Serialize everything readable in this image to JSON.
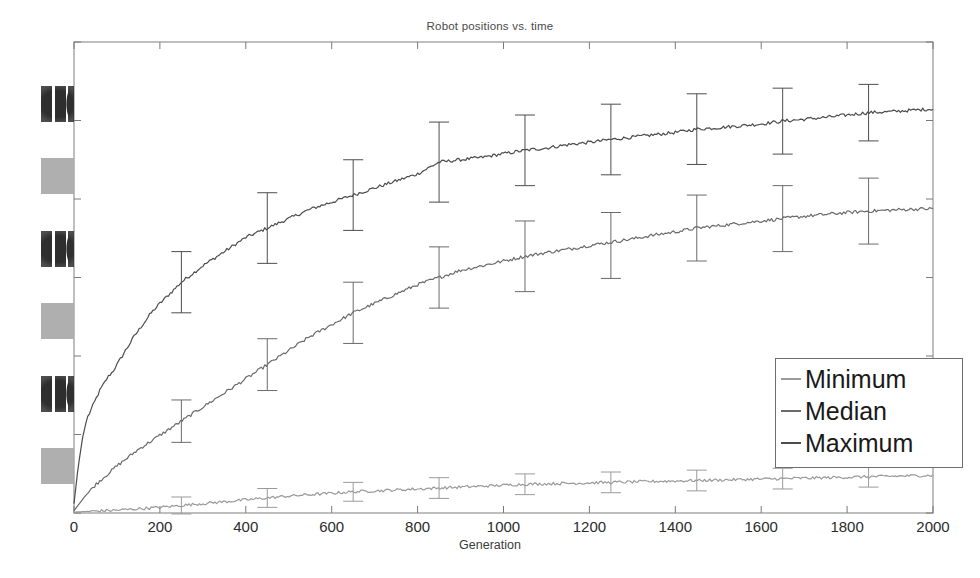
{
  "chart_data": {
    "type": "line",
    "title": "Robot positions vs. time",
    "xlabel": "Generation",
    "ylabel": "",
    "xlim": [
      0,
      2000
    ],
    "ylim": [
      0,
      1
    ],
    "xticks": [
      0,
      200,
      400,
      600,
      800,
      1000,
      1200,
      1400,
      1600,
      1800,
      2000
    ],
    "xtick_labels": [
      "0",
      "200",
      "400",
      "600",
      "800",
      "1000",
      "1200",
      "1400",
      "1600",
      "1800",
      "2000"
    ],
    "ytick_labels": [
      "",
      "",
      "",
      "",
      "",
      "",
      ""
    ],
    "ytick_labels_note": "y-axis tick labels are illegible in the source scan (degraded ink blocks)",
    "grid": false,
    "legend_position": "lower right",
    "series": [
      {
        "name": "Maximum",
        "color": "#4d4d4d",
        "x": [
          0,
          10,
          20,
          30,
          40,
          50,
          60,
          70,
          80,
          90,
          100,
          120,
          140,
          160,
          180,
          200,
          250,
          300,
          350,
          400,
          450,
          500,
          550,
          600,
          650,
          700,
          750,
          800,
          850,
          900,
          950,
          1000,
          1050,
          1100,
          1150,
          1200,
          1250,
          1300,
          1350,
          1400,
          1450,
          1500,
          1550,
          1600,
          1650,
          1700,
          1750,
          1800,
          1850,
          1900,
          1950,
          2000
        ],
        "y": [
          0.02,
          0.1,
          0.16,
          0.2,
          0.22,
          0.24,
          0.26,
          0.275,
          0.29,
          0.3,
          0.315,
          0.345,
          0.375,
          0.4,
          0.425,
          0.445,
          0.49,
          0.525,
          0.555,
          0.585,
          0.605,
          0.625,
          0.645,
          0.66,
          0.675,
          0.69,
          0.705,
          0.72,
          0.745,
          0.75,
          0.755,
          0.763,
          0.77,
          0.775,
          0.782,
          0.787,
          0.793,
          0.798,
          0.803,
          0.808,
          0.815,
          0.818,
          0.822,
          0.826,
          0.832,
          0.836,
          0.84,
          0.845,
          0.85,
          0.852,
          0.855,
          0.858
        ],
        "errorbars": {
          "x": [
            250,
            450,
            650,
            850,
            1050,
            1250,
            1450,
            1650,
            1850
          ],
          "y": [
            0.49,
            0.605,
            0.675,
            0.745,
            0.77,
            0.793,
            0.815,
            0.832,
            0.85
          ],
          "err": [
            0.065,
            0.075,
            0.075,
            0.085,
            0.075,
            0.075,
            0.075,
            0.07,
            0.06
          ]
        }
      },
      {
        "name": "Median",
        "color": "#6b6b6b",
        "x": [
          0,
          25,
          50,
          75,
          100,
          150,
          200,
          250,
          300,
          350,
          400,
          450,
          500,
          550,
          600,
          650,
          700,
          750,
          800,
          850,
          900,
          950,
          1000,
          1050,
          1100,
          1150,
          1200,
          1250,
          1300,
          1350,
          1400,
          1450,
          1500,
          1550,
          1600,
          1650,
          1700,
          1750,
          1800,
          1850,
          1900,
          1950,
          2000
        ],
        "y": [
          0.005,
          0.035,
          0.06,
          0.08,
          0.1,
          0.135,
          0.165,
          0.195,
          0.225,
          0.255,
          0.285,
          0.315,
          0.345,
          0.375,
          0.4,
          0.425,
          0.445,
          0.465,
          0.485,
          0.5,
          0.515,
          0.525,
          0.535,
          0.545,
          0.553,
          0.56,
          0.568,
          0.575,
          0.582,
          0.59,
          0.597,
          0.605,
          0.61,
          0.615,
          0.62,
          0.625,
          0.63,
          0.634,
          0.638,
          0.641,
          0.643,
          0.645,
          0.646
        ],
        "errorbars": {
          "x": [
            250,
            450,
            650,
            850,
            1050,
            1250,
            1450,
            1650,
            1850
          ],
          "y": [
            0.195,
            0.315,
            0.425,
            0.5,
            0.545,
            0.568,
            0.605,
            0.625,
            0.641
          ],
          "err": [
            0.045,
            0.055,
            0.065,
            0.065,
            0.075,
            0.07,
            0.07,
            0.07,
            0.07
          ]
        }
      },
      {
        "name": "Minimum",
        "color": "#9a9a9a",
        "x": [
          0,
          50,
          100,
          150,
          200,
          250,
          300,
          350,
          400,
          450,
          500,
          550,
          600,
          650,
          700,
          750,
          800,
          850,
          900,
          950,
          1000,
          1050,
          1100,
          1150,
          1200,
          1250,
          1300,
          1350,
          1400,
          1450,
          1500,
          1550,
          1600,
          1650,
          1700,
          1750,
          1800,
          1850,
          1900,
          1950,
          2000
        ],
        "y": [
          0.002,
          0.004,
          0.006,
          0.009,
          0.012,
          0.016,
          0.02,
          0.024,
          0.028,
          0.032,
          0.036,
          0.039,
          0.042,
          0.045,
          0.047,
          0.049,
          0.051,
          0.053,
          0.055,
          0.057,
          0.059,
          0.061,
          0.062,
          0.063,
          0.064,
          0.065,
          0.066,
          0.067,
          0.068,
          0.069,
          0.07,
          0.071,
          0.072,
          0.073,
          0.074,
          0.075,
          0.076,
          0.077,
          0.078,
          0.079,
          0.08
        ],
        "errorbars": {
          "x": [
            250,
            450,
            650,
            850,
            1050,
            1250,
            1450,
            1650,
            1850
          ],
          "y": [
            0.016,
            0.032,
            0.045,
            0.053,
            0.061,
            0.065,
            0.069,
            0.073,
            0.077
          ],
          "err": [
            0.018,
            0.02,
            0.02,
            0.022,
            0.022,
            0.022,
            0.022,
            0.022,
            0.022
          ]
        }
      }
    ],
    "legend": [
      {
        "label": "Minimum",
        "color": "#9a9a9a"
      },
      {
        "label": "Median",
        "color": "#6b6b6b"
      },
      {
        "label": "Maximum",
        "color": "#4d4d4d"
      }
    ]
  },
  "axes": {
    "frame_color": "#8a8a8a",
    "background": "#ffffff"
  }
}
